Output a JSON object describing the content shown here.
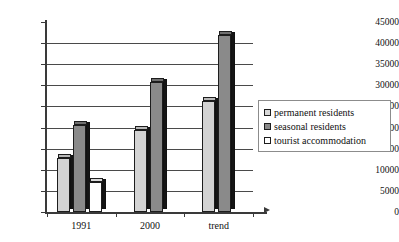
{
  "chart_data": {
    "type": "bar",
    "title": "",
    "xlabel": "",
    "ylabel": "",
    "categories": [
      "1991",
      "2000",
      "trend"
    ],
    "series": [
      {
        "name": "permanent residents",
        "key": "light",
        "values": [
          12800,
          19500,
          26300
        ]
      },
      {
        "name": "seasonal residents",
        "key": "dark",
        "values": [
          20600,
          30800,
          42000
        ]
      },
      {
        "name": "tourist accommodation",
        "key": "white",
        "values": [
          7000,
          null,
          null
        ]
      }
    ],
    "ylim": [
      0,
      45000
    ],
    "ytick_step": 5000,
    "yticks": [
      "45000",
      "40000",
      "35000",
      "30000",
      "25000",
      "20000",
      "15000",
      "10000",
      "5000",
      "0"
    ],
    "grid": true,
    "legend_position": "right",
    "colors": {
      "permanent_residents": "#d3d3d3",
      "seasonal_residents": "#8a8a8a",
      "tourist_accommodation": "#ffffff",
      "axis": "#3a3a3a",
      "gridline": "#4a4a4a",
      "text": "#111111",
      "background": "#ffffff"
    }
  },
  "legend": {
    "items": [
      {
        "label": "permanent residents",
        "swatch": "light"
      },
      {
        "label": "seasonal residents",
        "swatch": "dark"
      },
      {
        "label": "tourist accommodation",
        "swatch": "white"
      }
    ]
  }
}
